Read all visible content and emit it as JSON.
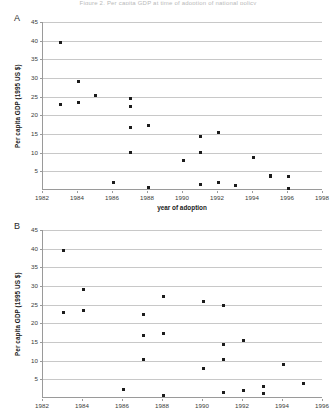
{
  "page": {
    "cut_off_header": "Figure 2. Per capita GDP at time of adoption of national policy"
  },
  "panels": [
    {
      "letter": "A",
      "ylabel": "Per capita GDP (1995 US $)",
      "xlabel": "year of adoption",
      "ytick_labels": [
        "45",
        "40",
        "35",
        "30",
        "25",
        "20",
        "15",
        "10",
        "5"
      ],
      "xtick_labels": [
        "1982",
        "1984",
        "1986",
        "1988",
        "1990",
        "1992",
        "1994",
        "1996",
        "1998"
      ]
    },
    {
      "letter": "B",
      "ylabel": "Per capita GDP (1995 US $)",
      "xlabel": "",
      "ytick_labels": [
        "45",
        "40",
        "35",
        "30",
        "25",
        "20",
        "15",
        "10",
        "5"
      ],
      "xtick_labels": [
        "1982",
        "1984",
        "1986",
        "1988",
        "1990",
        "1992",
        "1994",
        "1996"
      ]
    }
  ],
  "chart_data": [
    {
      "type": "scatter",
      "title": "A",
      "xlabel": "year of adoption",
      "ylabel": "Per capita GDP (1995 US $)",
      "xlim": [
        1982,
        1998
      ],
      "ylim": [
        0,
        45
      ],
      "xticks": [
        1982,
        1984,
        1986,
        1988,
        1990,
        1992,
        1994,
        1996,
        1998
      ],
      "yticks": [
        5,
        10,
        15,
        20,
        25,
        30,
        35,
        40,
        45
      ],
      "grid": "horizontal",
      "legend": "none",
      "marker": "filled-square",
      "points": [
        {
          "x": 1983,
          "y": 39.5
        },
        {
          "x": 1983,
          "y": 22.8
        },
        {
          "x": 1984,
          "y": 29.0
        },
        {
          "x": 1984,
          "y": 23.4
        },
        {
          "x": 1985,
          "y": 25.2
        },
        {
          "x": 1986,
          "y": 2.1
        },
        {
          "x": 1987,
          "y": 24.6
        },
        {
          "x": 1987,
          "y": 22.5
        },
        {
          "x": 1987,
          "y": 16.7
        },
        {
          "x": 1987,
          "y": 10.0
        },
        {
          "x": 1988,
          "y": 17.2
        },
        {
          "x": 1988,
          "y": 0.6
        },
        {
          "x": 1990,
          "y": 7.9
        },
        {
          "x": 1991,
          "y": 14.2
        },
        {
          "x": 1991,
          "y": 10.1
        },
        {
          "x": 1991,
          "y": 1.4
        },
        {
          "x": 1992,
          "y": 15.4
        },
        {
          "x": 1992,
          "y": 2.0
        },
        {
          "x": 1993,
          "y": 1.2
        },
        {
          "x": 1994,
          "y": 8.8
        },
        {
          "x": 1995,
          "y": 4.0
        },
        {
          "x": 1995,
          "y": 3.7
        },
        {
          "x": 1996,
          "y": 3.5
        },
        {
          "x": 1996,
          "y": 0.5
        }
      ]
    },
    {
      "type": "scatter",
      "title": "B",
      "xlabel": "",
      "ylabel": "Per capita GDP (1995 US $)",
      "xlim": [
        1982,
        1996
      ],
      "ylim": [
        0,
        45
      ],
      "xticks": [
        1982,
        1984,
        1986,
        1988,
        1990,
        1992,
        1994,
        1996
      ],
      "yticks": [
        5,
        10,
        15,
        20,
        25,
        30,
        35,
        40,
        45
      ],
      "grid": "horizontal",
      "legend": "none",
      "marker": "filled-square",
      "points": [
        {
          "x": 1983,
          "y": 39.5
        },
        {
          "x": 1983,
          "y": 22.8
        },
        {
          "x": 1984,
          "y": 29.0
        },
        {
          "x": 1984,
          "y": 23.4
        },
        {
          "x": 1986,
          "y": 2.2
        },
        {
          "x": 1987,
          "y": 22.5
        },
        {
          "x": 1987,
          "y": 16.8
        },
        {
          "x": 1987,
          "y": 10.2
        },
        {
          "x": 1988,
          "y": 27.3
        },
        {
          "x": 1988,
          "y": 17.2
        },
        {
          "x": 1988,
          "y": 0.7
        },
        {
          "x": 1990,
          "y": 25.8
        },
        {
          "x": 1990,
          "y": 7.9
        },
        {
          "x": 1991,
          "y": 24.9
        },
        {
          "x": 1991,
          "y": 14.2
        },
        {
          "x": 1991,
          "y": 10.3
        },
        {
          "x": 1991,
          "y": 1.4
        },
        {
          "x": 1992,
          "y": 15.5
        },
        {
          "x": 1992,
          "y": 2.1
        },
        {
          "x": 1993,
          "y": 3.1
        },
        {
          "x": 1993,
          "y": 1.3
        },
        {
          "x": 1994,
          "y": 9.0
        },
        {
          "x": 1995,
          "y": 4.0
        }
      ]
    }
  ],
  "colors": {
    "marker": "#1c1c1c",
    "grid": "#c8c8c8",
    "axis": "#9a9a9a",
    "text": "#3a3a3a"
  }
}
